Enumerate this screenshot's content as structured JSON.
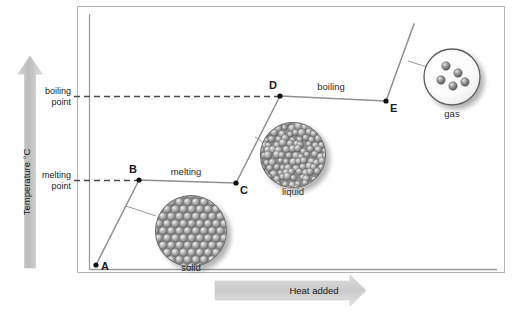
{
  "figure": {
    "type": "heating-curve-diagram",
    "background": "#ffffff",
    "frame_color": "#b0b0b0",
    "curve_color": "#8a8a8a",
    "dashed_color": "#4a4a4a",
    "axis_arrow_color": "#bdbdbd",
    "point_color": "#111111"
  },
  "axes": {
    "y_label": "Temperature °C",
    "x_label": "Heat added",
    "y_ticks": [
      {
        "id": "boiling",
        "line1": "boiling",
        "line2": "point",
        "y_px": 96
      },
      {
        "id": "melting",
        "line1": "melting",
        "line2": "point",
        "y_px": 180
      }
    ]
  },
  "chart_data": {
    "type": "line",
    "title": "",
    "xlabel": "Heat added",
    "ylabel": "Temperature °C",
    "grid": false,
    "legend": "none",
    "x": [
      0,
      1,
      2.3,
      3.3,
      5.7
    ],
    "series": [
      {
        "name": "heating curve",
        "points": [
          {
            "label": "A",
            "x_px": 96,
            "y_px": 265
          },
          {
            "label": "B",
            "x_px": 139,
            "y_px": 180
          },
          {
            "label": "C",
            "x_px": 236,
            "y_px": 183
          },
          {
            "label": "D",
            "x_px": 280,
            "y_px": 96
          },
          {
            "label": "E",
            "x_px": 386,
            "y_px": 101
          }
        ]
      }
    ],
    "segment_labels": [
      {
        "text": "melting",
        "between": "B-C",
        "x_px": 186,
        "y_px": 172
      },
      {
        "text": "boiling",
        "between": "D-E",
        "x_px": 330,
        "y_px": 88
      }
    ],
    "annotations": [
      {
        "text": "solid",
        "x_px": 191,
        "y_px": 267,
        "refers_to": "A-B"
      },
      {
        "text": "liquid",
        "x_px": 293,
        "y_px": 192,
        "refers_to": "C-D"
      },
      {
        "text": "gas",
        "x_px": 452,
        "y_px": 117,
        "refers_to": "after-E"
      }
    ]
  },
  "points": [
    {
      "label": "A",
      "cx": 96,
      "cy": 265,
      "label_dx": 5,
      "label_dy": 5
    },
    {
      "label": "B",
      "cx": 139,
      "cy": 180,
      "label_dx": -2,
      "label_dy": -7
    },
    {
      "label": "C",
      "cx": 236,
      "cy": 183,
      "label_dx": 4,
      "label_dy": 11
    },
    {
      "label": "D",
      "cx": 280,
      "cy": 96,
      "label_dx": -3,
      "label_dy": -7
    },
    {
      "label": "E",
      "cx": 386,
      "cy": 101,
      "label_dx": 4,
      "label_dy": 11
    }
  ],
  "state_circles": [
    {
      "name": "solid",
      "caption": "solid",
      "cx": 191,
      "cy": 231,
      "r": 36,
      "packing": "hexagonal-close-packed",
      "leader_from": {
        "x": 153,
        "y": 214
      },
      "leader_to": {
        "x": 126,
        "y": 205
      }
    },
    {
      "name": "liquid",
      "caption": "liquid",
      "cx": 293,
      "cy": 155,
      "r": 33,
      "packing": "dense-irregular",
      "leader_from": {
        "x": 261,
        "y": 141
      },
      "leader_to": {
        "x": 256,
        "y": 137
      }
    },
    {
      "name": "gas",
      "caption": "gas",
      "cx": 452,
      "cy": 77,
      "r": 28,
      "packing": "sparse-scattered",
      "particle_count": 5,
      "leader_from": {
        "x": 425,
        "y": 65
      },
      "leader_to": {
        "x": 410,
        "y": 62
      }
    }
  ],
  "arrows": {
    "y_axis_arrow": {
      "x": 30,
      "y_top": 56,
      "y_bottom": 268,
      "label": "Temperature °C"
    },
    "x_axis_arrow": {
      "y": 290,
      "x_left": 215,
      "x_right": 366,
      "label": "Heat added"
    }
  }
}
